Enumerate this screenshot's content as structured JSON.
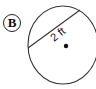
{
  "figure": {
    "label": "B",
    "measurement": "2 ft",
    "shape": "circle",
    "segment": "radius-like chord from edge to edge above center",
    "center_point": true,
    "colors": {
      "stroke": "#333333",
      "text": "#111111",
      "background": "#ffffff"
    }
  }
}
